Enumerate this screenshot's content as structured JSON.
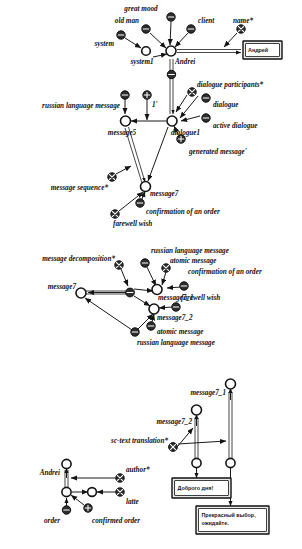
{
  "figure": {
    "kind": "node-link-diagram",
    "background": "#ffffff",
    "ink": "#111111"
  },
  "node_glyphs": {
    "open_circle": "open-circle-node",
    "minus_circle": "minus-circle-node",
    "plus_circle": "plus-circle-node",
    "cross_circle": "cross-circle-node"
  },
  "panels": [
    {
      "id": "panel-top",
      "name": "dialogue-structure-panel",
      "labels": [
        "great mood",
        "old man",
        "client",
        "name*",
        "system",
        "system1",
        "Andrei",
        "dialogue participants*",
        "dialogue",
        "active dialogue",
        "russian language message",
        "1'",
        "message5",
        "dialogue1",
        "generated message'",
        "message sequence*",
        "message7",
        "confirmation of an order",
        "farewell wish"
      ],
      "boxes": [
        {
          "name": "andrei-name-box",
          "text": "Андрей"
        }
      ]
    },
    {
      "id": "panel-middle",
      "name": "message-decomposition-panel",
      "labels": [
        "russian language message",
        "atomic message",
        "confirmation of an order",
        "message decomposition*",
        "message7_1",
        "message7",
        "farewell wish",
        "message7_2",
        "atomic message",
        "russian language message"
      ],
      "boxes": []
    },
    {
      "id": "panel-bottom",
      "name": "sc-text-translation-panel",
      "labels": [
        "message7_1",
        "message7_2",
        "sc-text translation*",
        "Andrei",
        "author*",
        "latte",
        "order",
        "confirmed order"
      ],
      "boxes": [
        {
          "name": "greeting-text-box",
          "text": "Доброго дня!"
        },
        {
          "name": "confirmation-text-box",
          "text": "Прекрасный выбор, ожидайте."
        }
      ]
    }
  ],
  "top": {
    "great_mood": "great mood",
    "old_man": "old man",
    "client": "client",
    "name_attr": "name*",
    "system": "system",
    "system1": "system1",
    "andrei": "Andrei",
    "andrei_box": "Андрей",
    "dialogue_participants": "dialogue participants*",
    "dialogue": "dialogue",
    "active_dialogue": "active dialogue",
    "russian_language_message": "russian language message",
    "one_prime": "1'",
    "message5": "message5",
    "dialogue1": "dialogue1",
    "generated_message": "generated message'",
    "message_sequence": "message sequence*",
    "message7": "message7",
    "confirmation_of_an_order": "confirmation of an order",
    "farewell_wish": "farewell wish"
  },
  "middle": {
    "russian_language_message_top": "russian language message",
    "atomic_message_top": "atomic message",
    "confirmation_of_an_order": "confirmation of an order",
    "message_decomposition": "message decomposition*",
    "message7_1": "message7_1",
    "message7": "message7",
    "farewell_wish": "farewell wish",
    "message7_2": "message7_2",
    "atomic_message_bottom": "atomic message",
    "russian_language_message_bottom": "russian language message"
  },
  "bottom": {
    "message7_1": "message7_1",
    "message7_2": "message7_2",
    "sc_text_translation": "sc-text translation*",
    "andrei": "Andrei",
    "author": "author*",
    "latte": "latte",
    "order": "order",
    "confirmed_order": "confirmed order",
    "greeting_box": "Доброго дня!",
    "confirmation_box": "Прекрасный выбор, ожидайте."
  }
}
